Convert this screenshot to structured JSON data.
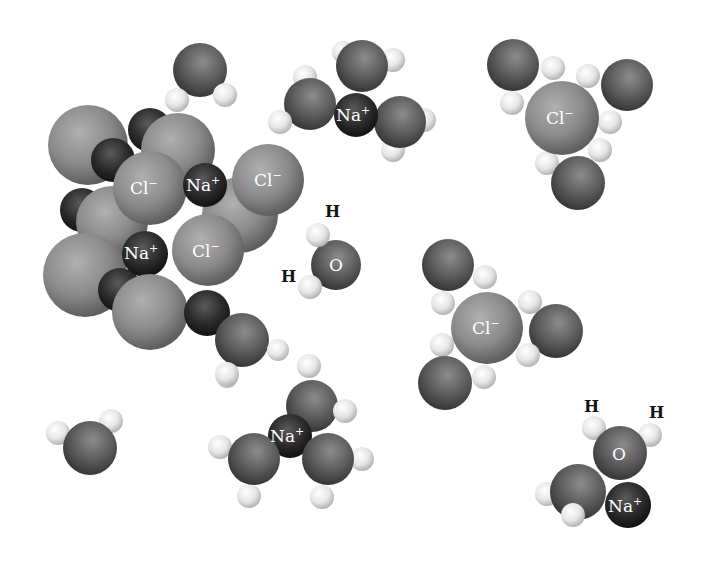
{
  "diagram": {
    "title": "",
    "colors": {
      "background": "#ffffff",
      "chloride": "#8a8a8a",
      "sodium": "#2a2a2a",
      "oxygen": "#5a5a5a",
      "hydrogen": "#e6e6e6",
      "label_light": "#ffffff",
      "label_dark": "#111111"
    },
    "labels": {
      "cl": "Cl",
      "cl_charge": "−",
      "na": "Na",
      "na_charge": "+",
      "o": "O",
      "h": "H"
    },
    "groups": [
      {
        "id": "crystal",
        "name": "NaCl crystal lattice"
      },
      {
        "id": "hydrated-na-top",
        "name": "Hydrated Na+ ion (top)"
      },
      {
        "id": "hydrated-cl-top-right",
        "name": "Hydrated Cl- ion (top right)"
      },
      {
        "id": "water-center",
        "name": "Labeled water molecule"
      },
      {
        "id": "hydrated-cl-middle-right",
        "name": "Hydrated Cl- ion (middle right)"
      },
      {
        "id": "hydrated-na-bottom",
        "name": "Hydrated Na+ ion (bottom)"
      },
      {
        "id": "water-na-bottom-right",
        "name": "Water molecule with Na+ (bottom right)"
      },
      {
        "id": "water-top",
        "name": "Free water molecule (top)"
      },
      {
        "id": "water-bottom-left",
        "name": "Free water molecule (bottom left)"
      }
    ]
  }
}
